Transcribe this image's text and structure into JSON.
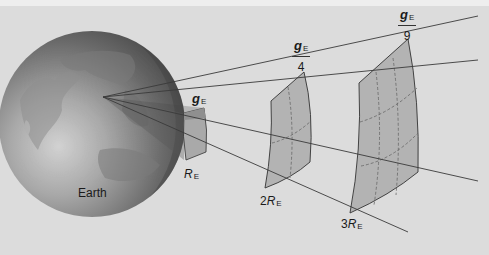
{
  "diagram": {
    "body_label": "Earth",
    "field_symbol": "g",
    "field_subscript": "E",
    "radius_symbol": "R",
    "radius_subscript": "E",
    "patches": [
      {
        "distance_label_prefix": "",
        "field_numerator": "g",
        "field_denominator": ""
      },
      {
        "distance_label_prefix": "2",
        "field_numerator": "g",
        "field_denominator": "4"
      },
      {
        "distance_label_prefix": "3",
        "field_numerator": "g",
        "field_denominator": "9"
      }
    ],
    "colors": {
      "background": "#dcdcdc",
      "top_band": "#eeeeee",
      "patch_fill": "#b3b3b3",
      "lines": "#3a3a3a",
      "earth_dark": "#4a4a4a",
      "earth_light": "#c8c8c8"
    }
  }
}
